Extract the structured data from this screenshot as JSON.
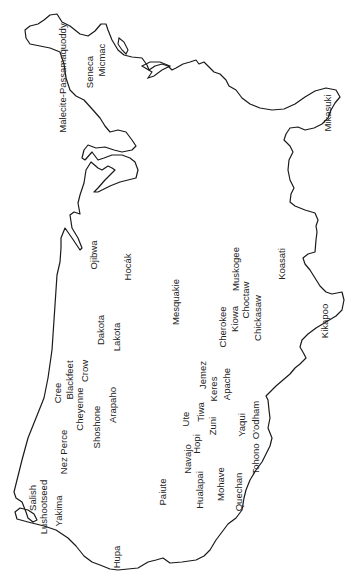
{
  "map": {
    "description": "Outline map of the United States rotated 90 degrees counter-clockwise, labeled with Native American tribe names",
    "rotation_deg": -90,
    "outline_color": "#1a1a1a",
    "background": "#ffffff"
  },
  "labels": [
    {
      "id": "malecite-passamaquoddy",
      "text": "Malecite-Passamaquoddy",
      "x": 62,
      "y": 78
    },
    {
      "id": "seneca",
      "text": "Seneca",
      "x": 89,
      "y": 72
    },
    {
      "id": "micmac",
      "text": "Micmac",
      "x": 101,
      "y": 60
    },
    {
      "id": "mikasuki",
      "text": "Mikasuki",
      "x": 327,
      "y": 113
    },
    {
      "id": "ojibwa",
      "text": "Ojibwa",
      "x": 93,
      "y": 255
    },
    {
      "id": "hocak",
      "text": "Hocák",
      "x": 127,
      "y": 267
    },
    {
      "id": "mesquakie",
      "text": "Mesquakie",
      "x": 175,
      "y": 302
    },
    {
      "id": "cherokee",
      "text": "Cherokee",
      "x": 222,
      "y": 327
    },
    {
      "id": "kiowa",
      "text": "Kiowa",
      "x": 234,
      "y": 319
    },
    {
      "id": "muskogee",
      "text": "Muskogee",
      "x": 235,
      "y": 269
    },
    {
      "id": "choctaw",
      "text": "Choctaw",
      "x": 245,
      "y": 300
    },
    {
      "id": "chickasaw",
      "text": "Chickasaw",
      "x": 257,
      "y": 318
    },
    {
      "id": "koasati",
      "text": "Koasati",
      "x": 281,
      "y": 264
    },
    {
      "id": "kikapoo",
      "text": "Kikapoo",
      "x": 324,
      "y": 321
    },
    {
      "id": "dakota",
      "text": "Dakota",
      "x": 100,
      "y": 330
    },
    {
      "id": "lakota",
      "text": "Lakota",
      "x": 116,
      "y": 337
    },
    {
      "id": "cree",
      "text": "Cree",
      "x": 57,
      "y": 393
    },
    {
      "id": "blackfeet",
      "text": "Blackfeet",
      "x": 69,
      "y": 380
    },
    {
      "id": "crow",
      "text": "Crow",
      "x": 84,
      "y": 371
    },
    {
      "id": "cheyenne",
      "text": "Cheyenne",
      "x": 79,
      "y": 409
    },
    {
      "id": "arapaho",
      "text": "Arapaho",
      "x": 112,
      "y": 405
    },
    {
      "id": "shoshone",
      "text": "Shoshone",
      "x": 96,
      "y": 427
    },
    {
      "id": "nez-perce",
      "text": "Nez Perce",
      "x": 63,
      "y": 452
    },
    {
      "id": "jemez",
      "text": "Jemez",
      "x": 202,
      "y": 375
    },
    {
      "id": "keres",
      "text": "Keres",
      "x": 213,
      "y": 389
    },
    {
      "id": "apache",
      "text": "Apache",
      "x": 226,
      "y": 384
    },
    {
      "id": "tiwa",
      "text": "Tiwa",
      "x": 200,
      "y": 412
    },
    {
      "id": "ute",
      "text": "Ute",
      "x": 185,
      "y": 419
    },
    {
      "id": "zuni",
      "text": "Zuni",
      "x": 212,
      "y": 426
    },
    {
      "id": "hopi",
      "text": "Hopi",
      "x": 196,
      "y": 444
    },
    {
      "id": "yaqui",
      "text": "Yaqui",
      "x": 241,
      "y": 425
    },
    {
      "id": "oodham",
      "text": "O'odham",
      "x": 255,
      "y": 420
    },
    {
      "id": "navajo",
      "text": "Navajo",
      "x": 187,
      "y": 459
    },
    {
      "id": "tohono",
      "text": "Tohono",
      "x": 255,
      "y": 459
    },
    {
      "id": "mohave",
      "text": "Mohave",
      "x": 220,
      "y": 484
    },
    {
      "id": "hualapai",
      "text": "Hualapai",
      "x": 199,
      "y": 490
    },
    {
      "id": "paiute",
      "text": "Paiute",
      "x": 162,
      "y": 492
    },
    {
      "id": "quechan",
      "text": "Quechan",
      "x": 238,
      "y": 492
    },
    {
      "id": "salish",
      "text": "Salish",
      "x": 32,
      "y": 498
    },
    {
      "id": "lushootseed",
      "text": "Lushootseed",
      "x": 43,
      "y": 507
    },
    {
      "id": "yakima",
      "text": "Yakima",
      "x": 58,
      "y": 511
    },
    {
      "id": "hupa",
      "text": "Hupa",
      "x": 116,
      "y": 557
    }
  ]
}
